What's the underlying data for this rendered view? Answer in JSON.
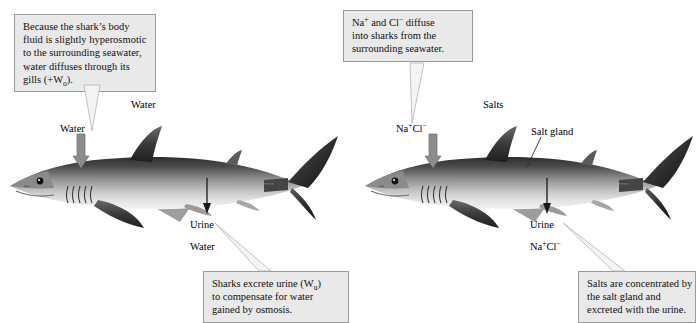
{
  "figure": {
    "background_color": "#ffffff",
    "callout_fill": "#e9e9e9",
    "callout_border": "#9a9a9a",
    "arrow_gray": "#8c8c8c",
    "arrow_black": "#1a1a1a"
  },
  "callouts": {
    "water_diffusion": {
      "line1": "Because the shark’s body",
      "line2": "fluid is slightly hyperosmotic",
      "line3": "to the surrounding seawater,",
      "line4": "water diffuses through its",
      "line5_prefix": "gills (+W",
      "line5_sub": "o",
      "line5_suffix": ")."
    },
    "salt_diffusion": {
      "line1_prefix": "Na",
      "line1_sup1": "+",
      "line1_mid": " and Cl",
      "line1_sup2": "−",
      "line1_suffix": " diffuse",
      "line2": "into sharks from the",
      "line3": "surrounding seawater."
    },
    "urine_excretion": {
      "line1_prefix": "Sharks excrete urine (W",
      "line1_sub": "u",
      "line1_suffix": ")",
      "line2": "to compensate for water",
      "line3": "gained by osmosis."
    },
    "salt_excretion": {
      "line1": "Salts are concentrated by",
      "line2": "the salt gland and",
      "line3": "excreted with the urine."
    }
  },
  "left_panel": {
    "label_water_top": "Water",
    "label_water_gill": "Water",
    "label_urine": "Urine",
    "label_water_urine": "Water",
    "shark_name": "shark-illustration-left"
  },
  "right_panel": {
    "label_salts_top": "Salts",
    "label_nacl_gill_prefix": "Na",
    "label_nacl_gill_sup1": "+",
    "label_nacl_gill_mid": "Cl",
    "label_nacl_gill_sup2": "−",
    "label_salt_gland": "Salt gland",
    "label_urine": "Urine",
    "label_nacl_urine_prefix": "Na",
    "label_nacl_urine_sup1": "+",
    "label_nacl_urine_mid": "Cl",
    "label_nacl_urine_sup2": "−",
    "shark_name": "shark-illustration-right"
  }
}
